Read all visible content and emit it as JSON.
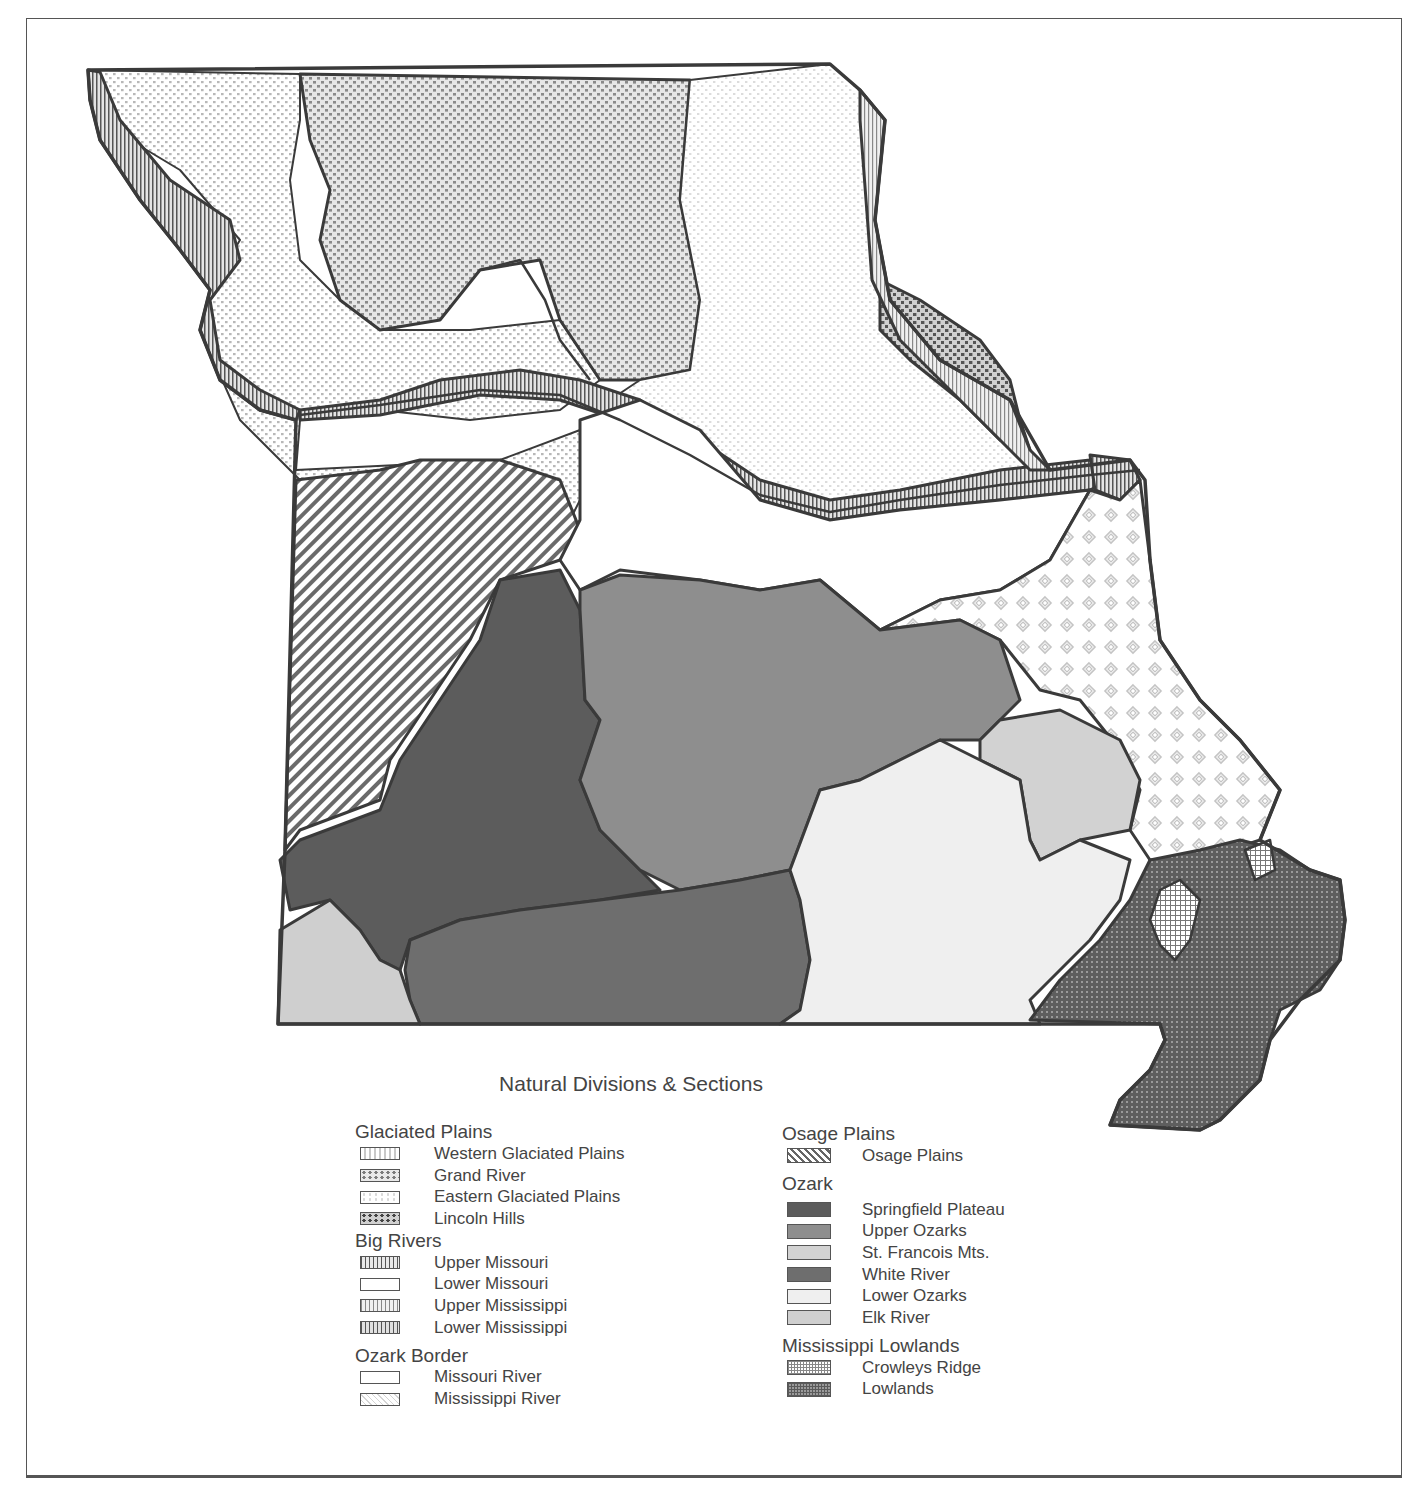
{
  "figure": {
    "legend_title": "Natural Divisions & Sections"
  },
  "legend": {
    "left_column": [
      {
        "division": "Glaciated Plains",
        "sections": [
          {
            "label": "Western Glaciated Plains",
            "swatch": "light-dots"
          },
          {
            "label": "Grand River",
            "swatch": "medium-dots"
          },
          {
            "label": "Eastern Glaciated Plains",
            "swatch": "faint-dots"
          },
          {
            "label": "Lincoln Hills",
            "swatch": "heavy-dots"
          }
        ]
      },
      {
        "division": "Big Rivers",
        "sections": [
          {
            "label": "Upper Missouri",
            "swatch": "heavy-vertical-lines"
          },
          {
            "label": "Lower Missouri",
            "swatch": "blank"
          },
          {
            "label": "Upper Mississippi",
            "swatch": "light-vertical-lines"
          },
          {
            "label": "Lower Mississippi",
            "swatch": "heavy-vertical-lines"
          }
        ]
      },
      {
        "division": "Ozark Border",
        "sections": [
          {
            "label": "Missouri River",
            "swatch": "blank"
          },
          {
            "label": "Mississippi River",
            "swatch": "diamond-lattice"
          }
        ]
      }
    ],
    "right_column": [
      {
        "division": "Osage Plains",
        "sections": [
          {
            "label": "Osage Plains",
            "swatch": "diagonal-hatch"
          }
        ]
      },
      {
        "division": "Ozark",
        "sections": [
          {
            "label": "Springfield Plateau",
            "swatch": "solid-dark-gray"
          },
          {
            "label": "Upper Ozarks",
            "swatch": "solid-medium-gray"
          },
          {
            "label": "St. Francois Mts.",
            "swatch": "solid-light-gray"
          },
          {
            "label": "White River",
            "swatch": "solid-dark-medium-gray"
          },
          {
            "label": "Lower Ozarks",
            "swatch": "solid-very-light-gray"
          },
          {
            "label": "Elk River",
            "swatch": "solid-light-medium-gray"
          }
        ]
      },
      {
        "division": "Mississippi Lowlands",
        "sections": [
          {
            "label": "Crowleys Ridge",
            "swatch": "light-grid"
          },
          {
            "label": "Lowlands",
            "swatch": "dark-grid"
          }
        ]
      }
    ]
  },
  "colors": {
    "outline": "#3a3a3a",
    "springfield_plateau": "#5c5c5c",
    "upper_ozarks": "#8e8e8e",
    "st_francois": "#d2d2d2",
    "white_river": "#6e6e6e",
    "lower_ozarks": "#efefef",
    "elk_river": "#cfcfcf",
    "lowlands": "#6a6a6a"
  }
}
